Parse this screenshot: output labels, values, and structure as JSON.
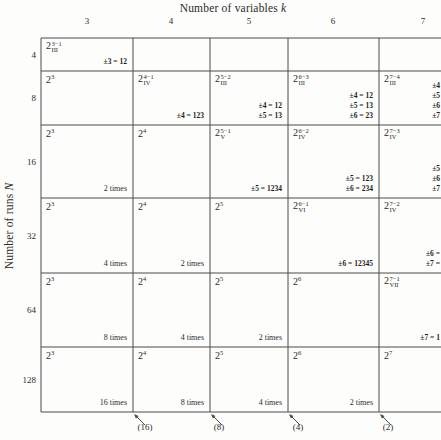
{
  "header": {
    "title": "Number of variables",
    "title_var": "k"
  },
  "y_axis": {
    "label": "Number of runs",
    "label_var": "N"
  },
  "columns": [
    "3",
    "4",
    "5",
    "6",
    "7"
  ],
  "grid": {
    "rows": [
      {
        "n": "4",
        "cells": [
          {
            "base": "2",
            "sup": "3−1",
            "sub": "III",
            "eqs": [
              "±3 = 12"
            ]
          },
          null,
          null,
          null,
          null
        ]
      },
      {
        "n": "8",
        "cells": [
          {
            "base": "2",
            "sup": "3"
          },
          {
            "base": "2",
            "sup": "4−1",
            "sub": "IV",
            "eqs": [
              "±4 = 123"
            ]
          },
          {
            "base": "2",
            "sup": "5−2",
            "sub": "III",
            "eqs": [
              "±4 = 12",
              "±5 = 13"
            ]
          },
          {
            "base": "2",
            "sup": "6−3",
            "sub": "III",
            "eqs": [
              "±4 = 12",
              "±5 = 13",
              "±6 = 23"
            ]
          },
          {
            "base": "2",
            "sup": "7−4",
            "sub": "III",
            "eqs": [
              "±4",
              "±5",
              "±6",
              "±7"
            ]
          }
        ]
      },
      {
        "n": "16",
        "cells": [
          {
            "base": "2",
            "sup": "3",
            "times": "2 times"
          },
          {
            "base": "2",
            "sup": "4"
          },
          {
            "base": "2",
            "sup": "5−1",
            "sub": "V",
            "eqs": [
              "±5 = 1234"
            ]
          },
          {
            "base": "2",
            "sup": "6−2",
            "sub": "IV",
            "eqs": [
              "±5 = 123",
              "±6 = 234"
            ]
          },
          {
            "base": "2",
            "sup": "7−3",
            "sub": "IV",
            "eqs": [
              "±5",
              "±6",
              "±7"
            ]
          }
        ]
      },
      {
        "n": "32",
        "cells": [
          {
            "base": "2",
            "sup": "3",
            "times": "4 times"
          },
          {
            "base": "2",
            "sup": "4",
            "times": "2 times"
          },
          {
            "base": "2",
            "sup": "5"
          },
          {
            "base": "2",
            "sup": "6−1",
            "sub": "VI",
            "eqs": [
              "±6 = 12345"
            ]
          },
          {
            "base": "2",
            "sup": "7−2",
            "sub": "IV",
            "eqs": [
              "±6 =",
              "±7 ="
            ]
          }
        ]
      },
      {
        "n": "64",
        "cells": [
          {
            "base": "2",
            "sup": "3",
            "times": "8 times"
          },
          {
            "base": "2",
            "sup": "4",
            "times": "4 times"
          },
          {
            "base": "2",
            "sup": "5",
            "times": "2 times"
          },
          {
            "base": "2",
            "sup": "6"
          },
          {
            "base": "2",
            "sup": "7−1",
            "sub": "VII",
            "eqs": [
              "±7 = 1"
            ]
          }
        ]
      },
      {
        "n": "128",
        "cells": [
          {
            "base": "2",
            "sup": "3",
            "times": "16 times"
          },
          {
            "base": "2",
            "sup": "4",
            "times": "8 times"
          },
          {
            "base": "2",
            "sup": "5",
            "times": "4 times"
          },
          {
            "base": "2",
            "sup": "6",
            "times": "2 times"
          },
          {
            "base": "2",
            "sup": "7"
          }
        ]
      }
    ]
  },
  "footer": {
    "arrow_labels": [
      "(16)",
      "(8)",
      "(4)",
      "(2)"
    ]
  },
  "colors": {
    "line": "#4a4a4a",
    "text": "#2b2b2b",
    "bold_text": "#1d1d1d",
    "background": "#fdfdfb"
  }
}
